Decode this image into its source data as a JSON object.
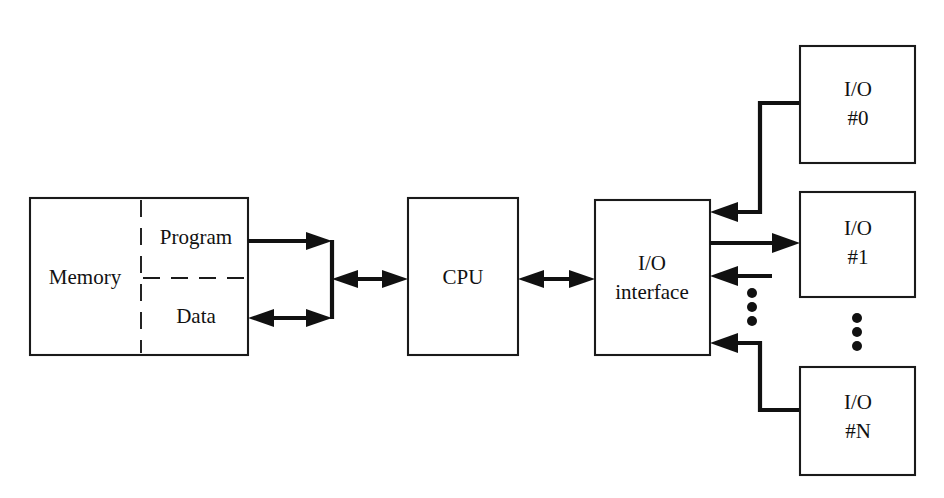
{
  "diagram": {
    "background_color": "#ffffff",
    "line_color": "#111111",
    "blocks": {
      "memory": {
        "label": "Memory",
        "program_label": "Program",
        "data_label": "Data"
      },
      "cpu": {
        "label": "CPU"
      },
      "io_interface": {
        "label_line1": "I/O",
        "label_line2": "interface"
      },
      "io_device_0": {
        "label_line1": "I/O",
        "label_line2": "#0"
      },
      "io_device_1": {
        "label_line1": "I/O",
        "label_line2": "#1"
      },
      "io_device_n": {
        "label_line1": "I/O",
        "label_line2": "#N"
      }
    },
    "ellipsis": {
      "interface_side_dots": 3,
      "device_side_dots": 3
    },
    "connections": [
      {
        "name": "program-to-bus",
        "from": "memory.program",
        "to": "memory-bus",
        "direction": "one-way"
      },
      {
        "name": "data-to-bus",
        "from": "memory.data",
        "to": "memory-bus",
        "direction": "two-way"
      },
      {
        "name": "bus-to-cpu",
        "from": "memory-bus",
        "to": "cpu",
        "direction": "two-way"
      },
      {
        "name": "cpu-to-io-interface",
        "from": "cpu",
        "to": "io_interface",
        "direction": "two-way"
      },
      {
        "name": "io0-to-interface",
        "from": "io_device_0",
        "to": "io_interface",
        "direction": "one-way"
      },
      {
        "name": "interface-to-io1",
        "from": "io_interface",
        "to": "io_device_1",
        "direction": "one-way"
      },
      {
        "name": "devices-to-interface",
        "from": "io_devices",
        "to": "io_interface",
        "direction": "one-way"
      },
      {
        "name": "ion-to-interface",
        "from": "io_device_n",
        "to": "io_interface",
        "direction": "one-way"
      }
    ]
  }
}
